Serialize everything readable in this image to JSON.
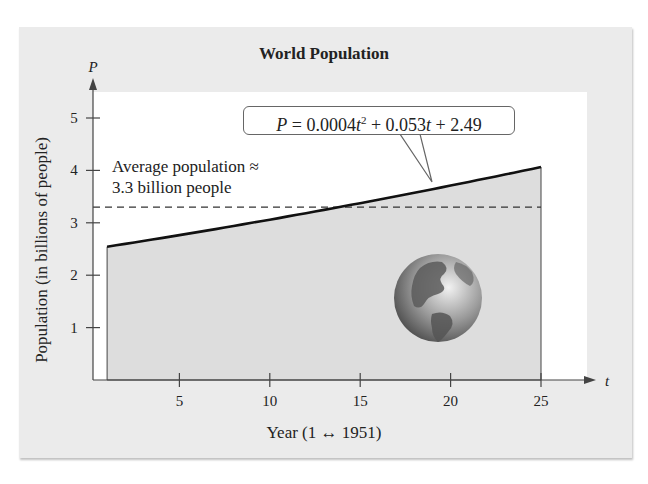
{
  "chart_data": {
    "type": "area",
    "title": "World Population",
    "xlabel": "Year (1 ↔ 1951)",
    "ylabel": "Population (in billions of people)",
    "x_axis_name": "t",
    "y_axis_name": "P",
    "xlim": [
      0,
      27
    ],
    "ylim": [
      0,
      5.5
    ],
    "x_ticks": [
      5,
      10,
      15,
      20,
      25
    ],
    "y_ticks": [
      1,
      2,
      3,
      4,
      5
    ],
    "grid": false,
    "model": {
      "equation": "P = 0.0004t^2 + 0.053t + 2.49",
      "coefficients": {
        "a": 0.0004,
        "b": 0.053,
        "c": 2.49
      },
      "domain": [
        1,
        25
      ]
    },
    "series": [
      {
        "name": "P = 0.0004t^2 + 0.053t + 2.49",
        "x": [
          1,
          5,
          10,
          15,
          20,
          25
        ],
        "values": [
          2.54,
          2.77,
          3.06,
          3.38,
          3.71,
          4.07
        ]
      }
    ],
    "reference_line": {
      "label": "Average population ≈ 3.3 billion people",
      "value": 3.3,
      "style": "dashed"
    },
    "annotations": [
      "P = 0.0004t² + 0.053t + 2.49",
      "Average population ≈ 3.3 billion people"
    ]
  },
  "labels": {
    "title": "World Population",
    "xlabel": "Year (1 ↔ 1951)",
    "ylabel": "Population (in billions of people)",
    "x_axis_name": "t",
    "y_axis_name": "P",
    "avg_text": "Average population ≈\n3.3 billion people",
    "eq_P": "P",
    "eq_mid": " = 0.0004",
    "eq_t1": "t",
    "eq_exp": "2",
    "eq_mid2": " + 0.053",
    "eq_t2": "t",
    "eq_end": " + 2.49",
    "xt": [
      "5",
      "10",
      "15",
      "20",
      "25"
    ],
    "yt": [
      "1",
      "2",
      "3",
      "4",
      "5"
    ]
  },
  "colors": {
    "panel": "#ebebeb",
    "plot": "#ffffff",
    "fill": "#dcdcdc",
    "line": "#111111"
  }
}
